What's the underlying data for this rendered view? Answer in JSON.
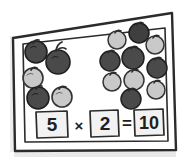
{
  "card": {
    "title": "multiplication-fruit-card",
    "background_color": "#ffffff",
    "ink_color": "#2b2b2b",
    "shadow_color": "#d8d8d8"
  },
  "groups": [
    {
      "name": "left-group",
      "count": 5,
      "label": "5",
      "fruits": [
        {
          "cx": 36,
          "cy": 52,
          "r": 11,
          "shade": "dark",
          "stem_angle": -25
        },
        {
          "cx": 58,
          "cy": 62,
          "r": 12,
          "shade": "dark",
          "stem_angle": -10
        },
        {
          "cx": 33,
          "cy": 78,
          "r": 10,
          "shade": "light",
          "stem_angle": -30
        },
        {
          "cx": 38,
          "cy": 98,
          "r": 11,
          "shade": "dark",
          "stem_angle": -15
        },
        {
          "cx": 62,
          "cy": 97,
          "r": 10,
          "shade": "light",
          "stem_angle": -35
        }
      ]
    },
    {
      "name": "right-group",
      "count": 10,
      "label": "2",
      "fruits": [
        {
          "cx": 117,
          "cy": 40,
          "r": 9,
          "shade": "light",
          "stem_angle": -20
        },
        {
          "cx": 139,
          "cy": 33,
          "r": 10,
          "shade": "dark",
          "stem_angle": -12
        },
        {
          "cx": 155,
          "cy": 45,
          "r": 9,
          "shade": "light",
          "stem_angle": -25
        },
        {
          "cx": 110,
          "cy": 61,
          "r": 10,
          "shade": "dark",
          "stem_angle": -18
        },
        {
          "cx": 133,
          "cy": 58,
          "r": 11,
          "shade": "dark",
          "stem_angle": -8
        },
        {
          "cx": 157,
          "cy": 68,
          "r": 10,
          "shade": "dark",
          "stem_angle": -22
        },
        {
          "cx": 112,
          "cy": 82,
          "r": 9,
          "shade": "light",
          "stem_angle": -28
        },
        {
          "cx": 134,
          "cy": 80,
          "r": 10,
          "shade": "light",
          "stem_angle": -14
        },
        {
          "cx": 156,
          "cy": 90,
          "r": 9,
          "shade": "light",
          "stem_angle": -20
        },
        {
          "cx": 131,
          "cy": 99,
          "r": 10,
          "shade": "dark",
          "stem_angle": -16
        }
      ]
    }
  ],
  "equation": {
    "name": "multiplication-equation",
    "expression": "5 × 2 = 10",
    "multiplicand": "5",
    "times_symbol": "×",
    "multiplier": "2",
    "equals_symbol": "=",
    "product": "10"
  },
  "palette": {
    "fruit_dark": "#4a4a4a",
    "fruit_dark_edge": "#262626",
    "fruit_light": "#c9c9c9",
    "fruit_light_edge": "#3a3a3a",
    "stem_color": "#2b2b2b",
    "box_fill": "#f2f2f2",
    "box_stroke": "#2b2b2b"
  }
}
